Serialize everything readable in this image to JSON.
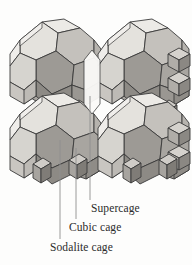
{
  "figure": {
    "background_color": "#fdfdfc",
    "edge_color": "#3a3a3a",
    "leader_line_color": "#8e8e8e",
    "face_colors": {
      "highlight": "#eceae6",
      "light": "#d9d7d2",
      "mid_light": "#c6c3be",
      "mid": "#b2afaa",
      "mid_dark": "#9d9a95",
      "dark": "#8a8782",
      "darkest": "#77736f"
    }
  },
  "labels": [
    {
      "id": "supercage",
      "text": "Supercage",
      "leader": {
        "x": 90,
        "y_top": 96,
        "y_bottom": 200
      }
    },
    {
      "id": "cubic-cage",
      "text": "Cubic cage",
      "leader": {
        "x": 76,
        "y_top": 148,
        "y_bottom": 219
      }
    },
    {
      "id": "sodalite-cage",
      "text": "Sodalite cage",
      "leader": {
        "x": 60,
        "y_top": 140,
        "y_bottom": 239
      }
    }
  ],
  "structure": {
    "description": "Four truncated octahedral sodalite cages in a 2x2 array linked by small cubic prisms, enclosing a central supercage void",
    "cage_count": 4,
    "cage_type": "truncated octahedron",
    "linker_type": "cubic prism"
  }
}
